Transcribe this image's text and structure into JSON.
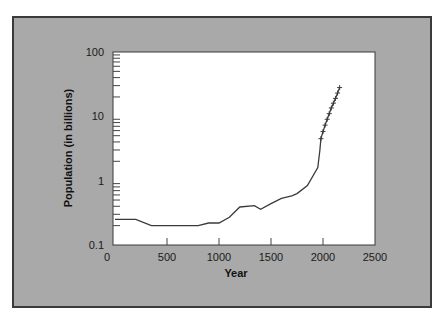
{
  "chart_data": {
    "type": "line",
    "title": "",
    "xlabel": "Year",
    "ylabel": "Population (in billions)",
    "xlim": [
      0,
      2500
    ],
    "ylim": [
      0.1,
      100
    ],
    "yscale": "log",
    "grid": false,
    "legend": null,
    "x_ticks": [
      "0",
      "500",
      "1000",
      "1500",
      "2000",
      "2500"
    ],
    "y_ticks": [
      "0.1",
      "1",
      "10",
      "100"
    ],
    "series": [
      {
        "name": "Historical population",
        "style": "line",
        "x": [
          0,
          200,
          350,
          800,
          900,
          1000,
          1100,
          1200,
          1340,
          1400,
          1500,
          1600,
          1700,
          1750,
          1850,
          1950,
          1970
        ],
        "values": [
          0.25,
          0.25,
          0.2,
          0.2,
          0.22,
          0.22,
          0.27,
          0.39,
          0.41,
          0.36,
          0.44,
          0.53,
          0.58,
          0.63,
          0.84,
          1.6,
          3.0
        ]
      },
      {
        "name": "Projected population",
        "style": "line-with-cross-markers",
        "x": [
          1980,
          2000,
          2020,
          2040,
          2060,
          2080,
          2100,
          2120,
          2140,
          2160
        ],
        "values": [
          4.5,
          5.8,
          7.3,
          9.0,
          11,
          13.5,
          16,
          19,
          23,
          28
        ]
      }
    ]
  },
  "colors": {
    "frame_bg": "#a9a9a9",
    "frame_border": "#3a3a3a",
    "plot_bg": "#ffffff",
    "line": "#3b3b3b"
  }
}
